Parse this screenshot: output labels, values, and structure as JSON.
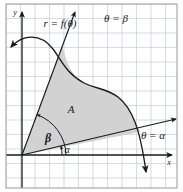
{
  "figure": {
    "type": "polar-area-diagram",
    "background_color": "#fefefe",
    "frame_color": "#9a9a9a",
    "grid_color": "#c3cfd8",
    "ink_color": "#1a1a1a",
    "region_fill_color": "#d2d2d2",
    "region_stroke_color": "#2b2b2b"
  },
  "axes": {
    "x_axis_label": "x",
    "y_axis_label": "y",
    "origin": {
      "x": 22,
      "y": 155
    },
    "x_axis_arrow_tip": {
      "x": 172,
      "y": 155
    },
    "y_axis_arrow_tip": {
      "x": 22,
      "y": 12
    }
  },
  "grid": {
    "visible": true,
    "cell_size_px": 14.5,
    "left": 6,
    "top": 4,
    "right": 177,
    "bottom": 188
  },
  "labels": {
    "curve": "r = f(θ)",
    "ray_beta": "θ = β",
    "ray_alpha": "θ = α",
    "area": "A",
    "angle_beta": "β",
    "angle_alpha": "α"
  },
  "annotations": [
    {
      "name": "curve-callout",
      "text": "r = f(θ)",
      "x": 60,
      "y": 24,
      "anchor": "middle"
    },
    {
      "name": "ray-beta-label",
      "text": "θ = β",
      "x": 117,
      "y": 20,
      "anchor": "middle"
    },
    {
      "name": "ray-alpha-label",
      "text": "θ = α",
      "x": 155,
      "y": 134,
      "anchor": "middle"
    },
    {
      "name": "area-label",
      "text": "A",
      "x": 70,
      "y": 110,
      "anchor": "middle"
    },
    {
      "name": "angle-beta-label",
      "text": "β",
      "x": 47,
      "y": 140,
      "anchor": "middle"
    },
    {
      "name": "angle-alpha-label",
      "text": "α",
      "x": 64,
      "y": 152,
      "anchor": "middle"
    }
  ],
  "rays": {
    "beta": {
      "from": {
        "x": 22,
        "y": 155
      },
      "to": {
        "x": 73,
        "y": 15
      },
      "arrow": true
    },
    "alpha": {
      "from": {
        "x": 22,
        "y": 155
      },
      "to": {
        "x": 176,
        "y": 119
      },
      "arrow": true
    }
  },
  "curve": {
    "description": "r = f(theta) arc with arrowheads at both ends, sweeping from upper-left down across to lower-right",
    "path": "M 10 46 C 20 36, 38 32, 52 48 C 62 60, 66 73, 84 83 C 98 90, 104 87, 118 97 C 132 108, 140 126, 147 176",
    "start_arrow": true,
    "end_arrow": true
  },
  "region": {
    "description": "Shaded area A bounded by the two rays and the curve",
    "path": "M 22 155 L 62 46 C 66 55, 67 73, 84 83 C 98 90, 104 87, 118 97 C 128 106, 135 118, 140 132 Z"
  },
  "angle_arcs": {
    "beta": {
      "center": {
        "x": 22,
        "y": 155
      },
      "radius": 44,
      "from_deg": 0,
      "to_deg": 70
    },
    "alpha": {
      "center": {
        "x": 22,
        "y": 155
      },
      "radius": 40,
      "from_deg": 0,
      "to_deg": 13
    }
  }
}
